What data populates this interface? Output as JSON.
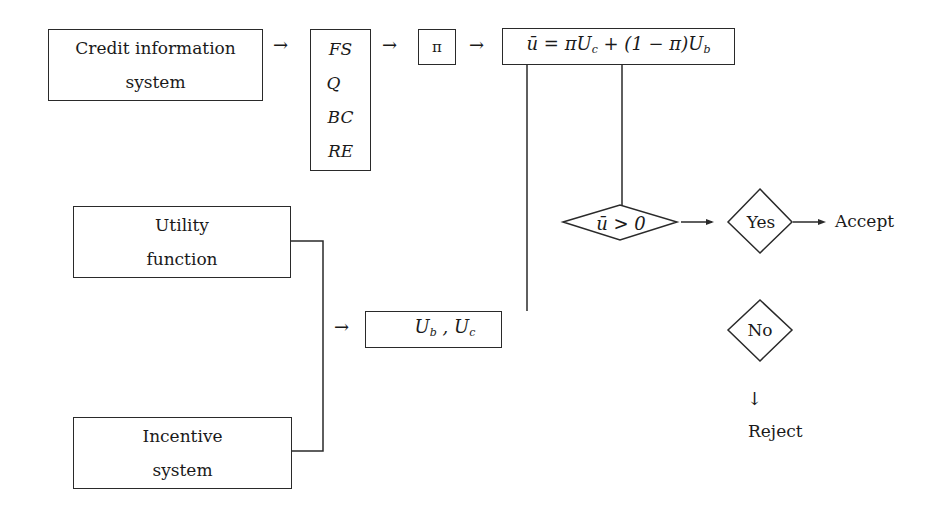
{
  "nodes": {
    "credit_info": {
      "line1": "Credit information",
      "line2": "system"
    },
    "factors": {
      "items": [
        "FS",
        "Q",
        "BC",
        "RE"
      ]
    },
    "probability": {
      "label": "π"
    },
    "expected_utility": {
      "lhs": "ū",
      "eq": " = πU",
      "sub_c": "c",
      "mid": " + (1 − π)U",
      "sub_b": "b"
    },
    "utility_function": {
      "line1": "Utility",
      "line2": "function"
    },
    "incentive_system": {
      "line1": "Incentive",
      "line2": "system"
    },
    "utilities": {
      "u1": "U",
      "s1": "b",
      "sep": " , ",
      "u2": "U",
      "s2": "c"
    },
    "decision": {
      "label": "ū > 0"
    },
    "yes": {
      "label": "Yes"
    },
    "no": {
      "label": "No"
    }
  },
  "outcomes": {
    "accept": "Accept",
    "reject": "Reject"
  },
  "arrows": {
    "right": "→",
    "down": "↓"
  }
}
